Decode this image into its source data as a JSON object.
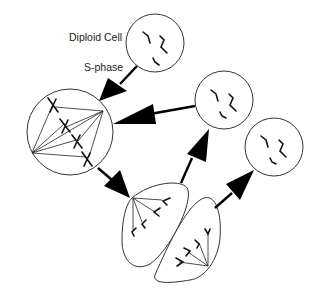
{
  "diagram": {
    "labels": {
      "diploid_cell": "Diploid Cell",
      "s_phase": "S-phase"
    },
    "stages": [
      {
        "id": "diploid-cell",
        "description": "Diploid cell with unreplicated chromosomes"
      },
      {
        "id": "metaphase-cell",
        "description": "Cell with replicated X-shaped chromosomes on spindle"
      },
      {
        "id": "anaphase-telophase-cell",
        "description": "Dividing cell with chromosomes pulled to poles"
      },
      {
        "id": "daughter-cell-1",
        "description": "Diploid daughter cell"
      },
      {
        "id": "daughter-cell-2",
        "description": "Diploid daughter cell"
      }
    ],
    "colors": {
      "stroke": "#333333",
      "arrow": "#000000",
      "background": "#ffffff"
    }
  }
}
